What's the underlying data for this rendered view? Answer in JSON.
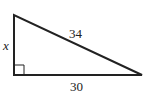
{
  "diagram": {
    "type": "right-triangle",
    "labels": {
      "vertical_leg": "x",
      "hypotenuse": "34",
      "horizontal_leg": "30"
    },
    "right_angle_marker": true,
    "colors": {
      "stroke": "#222222",
      "background": "#ffffff"
    }
  }
}
